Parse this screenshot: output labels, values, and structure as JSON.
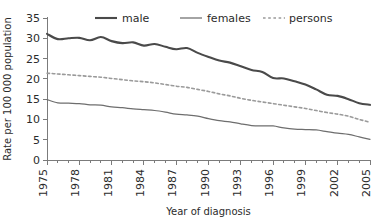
{
  "chart_data": {
    "type": "line",
    "title": "",
    "xlabel": "Year of diagnosis",
    "ylabel": "Rate per 100 000 population",
    "xlim": [
      1975,
      2005
    ],
    "ylim": [
      0,
      35
    ],
    "ytick_labels": [
      "0",
      "5",
      "10",
      "15",
      "20",
      "25",
      "30",
      "35"
    ],
    "ytick_values": [
      0,
      5,
      10,
      15,
      20,
      25,
      30,
      35
    ],
    "xtick_labels": [
      "1975",
      "1978",
      "1981",
      "1984",
      "1987",
      "1990",
      "1993",
      "1996",
      "1999",
      "2002",
      "2005"
    ],
    "xtick_values": [
      1975,
      1978,
      1981,
      1984,
      1987,
      1990,
      1993,
      1996,
      1999,
      2002,
      2005
    ],
    "minor_xticks_every": 1,
    "grid": false,
    "legend_position": "top",
    "x": [
      1975,
      1976,
      1977,
      1978,
      1979,
      1980,
      1981,
      1982,
      1983,
      1984,
      1985,
      1986,
      1987,
      1988,
      1989,
      1990,
      1991,
      1992,
      1993,
      1994,
      1995,
      1996,
      1997,
      1998,
      1999,
      2000,
      2001,
      2002,
      2003,
      2004,
      2005
    ],
    "series": [
      {
        "name": "male",
        "style": "solid-thick",
        "color": "#4a4a4a",
        "values": [
          31.1,
          29.8,
          30.0,
          30.1,
          29.5,
          30.3,
          29.3,
          28.8,
          29.0,
          28.2,
          28.6,
          27.9,
          27.3,
          27.6,
          26.4,
          25.4,
          24.5,
          24.0,
          23.1,
          22.2,
          21.7,
          20.2,
          20.1,
          19.4,
          18.6,
          17.4,
          16.1,
          15.8,
          15.0,
          14.0,
          13.6
        ]
      },
      {
        "name": "females",
        "style": "solid-thin",
        "color": "#6e6e6e",
        "values": [
          14.9,
          14.1,
          14.0,
          13.9,
          13.6,
          13.5,
          13.1,
          12.9,
          12.6,
          12.4,
          12.2,
          11.8,
          11.3,
          11.1,
          10.8,
          10.2,
          9.7,
          9.4,
          8.9,
          8.5,
          8.4,
          8.4,
          7.9,
          7.6,
          7.5,
          7.4,
          7.0,
          6.6,
          6.3,
          5.7,
          5.1
        ]
      },
      {
        "name": "persons",
        "style": "dashed",
        "color": "#9a9a9a",
        "values": [
          21.4,
          21.2,
          21.0,
          20.8,
          20.6,
          20.4,
          20.1,
          19.8,
          19.5,
          19.3,
          19.0,
          18.6,
          18.2,
          17.9,
          17.4,
          16.9,
          16.3,
          15.8,
          15.2,
          14.7,
          14.3,
          13.9,
          13.5,
          13.1,
          12.7,
          12.2,
          11.7,
          11.3,
          10.8,
          10.0,
          9.3
        ]
      }
    ],
    "legend": [
      {
        "label": "male",
        "style": "solid-thick",
        "color": "#4a4a4a"
      },
      {
        "label": "females",
        "style": "solid-thin",
        "color": "#6e6e6e"
      },
      {
        "label": "persons",
        "style": "dashed",
        "color": "#9a9a9a"
      }
    ]
  }
}
